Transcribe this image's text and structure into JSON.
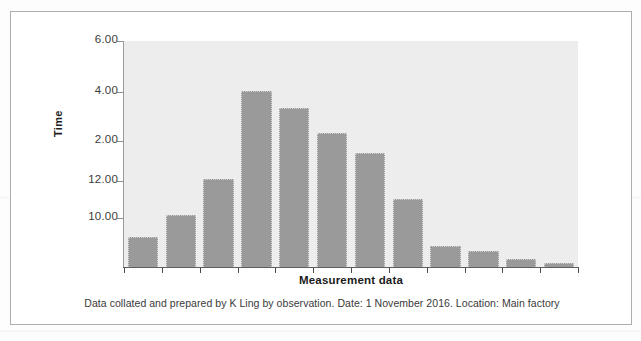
{
  "figure": {
    "caption": "Data collated and prepared by K Ling by observation. Date: 1 November 2016. Location: Main factory",
    "frame_color": "#adadad",
    "plot_background": "#ededed"
  },
  "chart_data": {
    "type": "bar",
    "title": "",
    "xlabel": "Measurement data",
    "ylabel": "Time",
    "grid": false,
    "legend": null,
    "bar_color": "#9a9a9a",
    "categories": [
      "1",
      "2",
      "3",
      "4",
      "5",
      "6",
      "7",
      "8",
      "9",
      "10",
      "11",
      "12"
    ],
    "x_tick_labels": [
      "",
      "",
      "",
      "",
      "",
      "",
      "",
      "",
      "",
      "",
      "",
      ""
    ],
    "y_tick_labels": [
      "6.00",
      "4.00",
      "2.00",
      "12.00",
      "10.00"
    ],
    "y_tick_pixel_y": [
      40,
      91,
      140,
      180,
      217
    ],
    "ylim_pixel": [
      40,
      266
    ],
    "values": [
      0.8,
      1.25,
      1.95,
      5.05,
      4.4,
      3.6,
      3.1,
      1.6,
      0.48,
      0.38,
      0.2,
      0.1
    ],
    "bar_pixel_tops": [
      236,
      214,
      178,
      90,
      107,
      132,
      152,
      198,
      245,
      250,
      258,
      262
    ],
    "baseline_pixel_y": 266,
    "annotations": []
  }
}
